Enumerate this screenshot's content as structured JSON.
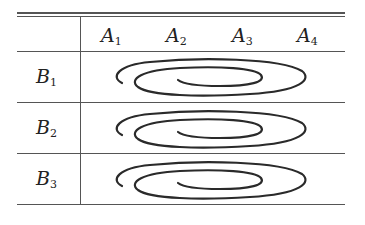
{
  "table": {
    "column_headers": [
      {
        "letter": "A",
        "sub": "1"
      },
      {
        "letter": "A",
        "sub": "2"
      },
      {
        "letter": "A",
        "sub": "3"
      },
      {
        "letter": "A",
        "sub": "4"
      }
    ],
    "rows": [
      {
        "letter": "B",
        "sub": "1",
        "cell": "spiral"
      },
      {
        "letter": "B",
        "sub": "2",
        "cell": "spiral"
      },
      {
        "letter": "B",
        "sub": "3",
        "cell": "spiral"
      }
    ]
  },
  "colors": {
    "rule": "#555555",
    "stroke": "#2a2a2a",
    "text": "#222222"
  }
}
